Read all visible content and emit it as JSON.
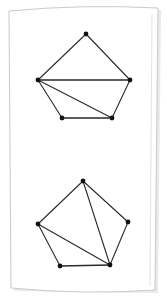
{
  "scene": {
    "title": "Hand-drawn graph sketch on white paper",
    "background_color": "#ffffff",
    "paper": {
      "fill_color": "#ffffff",
      "border_color": "#c9c9c9",
      "shadow_color": "#d8d8d8",
      "corners": {
        "top_left": [
          9,
          11
        ],
        "top_right": [
          158,
          8
        ],
        "bottom_right": [
          155,
          290
        ],
        "bottom_left": [
          11,
          288
        ]
      },
      "top_edge_curve": "bowed upward slightly at center",
      "bottom_edge_curve": "bowed downward slightly at center"
    },
    "ink": {
      "edge_color": "#2a2a2a",
      "vertex_color": "#111111",
      "edge_width": 1.1,
      "vertex_radius": 2.4
    }
  },
  "diagram": {
    "type": "graph-drawing",
    "graph_count": 2,
    "graphs": [
      {
        "id": "graph-top",
        "name": "upper-graph",
        "vertex_count": 5,
        "edge_count": 7,
        "vertices": [
          {
            "id": "t1",
            "label": "apex",
            "x": 86,
            "y": 34
          },
          {
            "id": "t2",
            "label": "left",
            "x": 38,
            "y": 80
          },
          {
            "id": "t3",
            "label": "right",
            "x": 130,
            "y": 80
          },
          {
            "id": "t4",
            "label": "bottom-left",
            "x": 62,
            "y": 118
          },
          {
            "id": "t5",
            "label": "bottom-right",
            "x": 112,
            "y": 118
          }
        ],
        "edges": [
          {
            "from": "t1",
            "to": "t2"
          },
          {
            "from": "t1",
            "to": "t3"
          },
          {
            "from": "t2",
            "to": "t3"
          },
          {
            "from": "t2",
            "to": "t4"
          },
          {
            "from": "t2",
            "to": "t5"
          },
          {
            "from": "t3",
            "to": "t5"
          },
          {
            "from": "t4",
            "to": "t5"
          }
        ],
        "degrees": {
          "t1": 2,
          "t2": 4,
          "t3": 3,
          "t4": 2,
          "t5": 3
        }
      },
      {
        "id": "graph-bottom",
        "name": "lower-graph",
        "vertex_count": 5,
        "edge_count": 7,
        "vertices": [
          {
            "id": "b1",
            "label": "apex",
            "x": 83,
            "y": 181
          },
          {
            "id": "b2",
            "label": "left",
            "x": 38,
            "y": 224
          },
          {
            "id": "b3",
            "label": "right",
            "x": 128,
            "y": 222
          },
          {
            "id": "b4",
            "label": "bottom-left",
            "x": 60,
            "y": 266
          },
          {
            "id": "b5",
            "label": "bottom-right",
            "x": 110,
            "y": 265
          }
        ],
        "edges": [
          {
            "from": "b1",
            "to": "b2"
          },
          {
            "from": "b1",
            "to": "b3"
          },
          {
            "from": "b1",
            "to": "b5"
          },
          {
            "from": "b2",
            "to": "b4"
          },
          {
            "from": "b2",
            "to": "b5"
          },
          {
            "from": "b3",
            "to": "b5"
          },
          {
            "from": "b4",
            "to": "b5"
          }
        ],
        "degrees": {
          "b1": 3,
          "b2": 3,
          "b3": 2,
          "b4": 2,
          "b5": 4
        }
      }
    ]
  }
}
